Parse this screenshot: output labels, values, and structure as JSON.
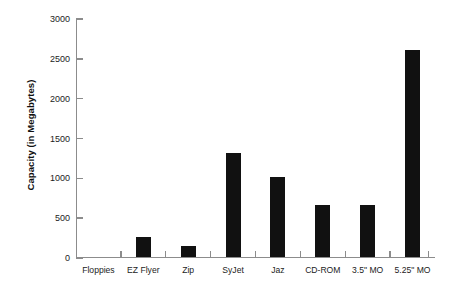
{
  "chart_data": {
    "type": "bar",
    "title": "",
    "subtitle": "",
    "xlabel": "",
    "ylabel": "Capacity (in Megabytes)",
    "categories": [
      "Floppies",
      "EZ Flyer",
      "Zip",
      "SyJet",
      "Jaz",
      "CD-ROM",
      "3.5\" MO",
      "5.25\" MO"
    ],
    "values": [
      0,
      250,
      140,
      1300,
      1000,
      650,
      650,
      2600
    ],
    "series": [
      {
        "name": "Capacity",
        "values": [
          0,
          250,
          140,
          1300,
          1000,
          650,
          650,
          2600
        ]
      }
    ],
    "ylim": [
      0,
      3000
    ],
    "ytick_labels": [
      "3000",
      "2500",
      "2000",
      "1500",
      "1000",
      "500",
      "0"
    ],
    "ytick_values": [
      3000,
      2500,
      2000,
      1500,
      1000,
      500,
      0
    ],
    "grid": false,
    "legend": false,
    "legend_position": "none",
    "bar_color": "#111111",
    "axis_color": "#8c8c8c"
  }
}
